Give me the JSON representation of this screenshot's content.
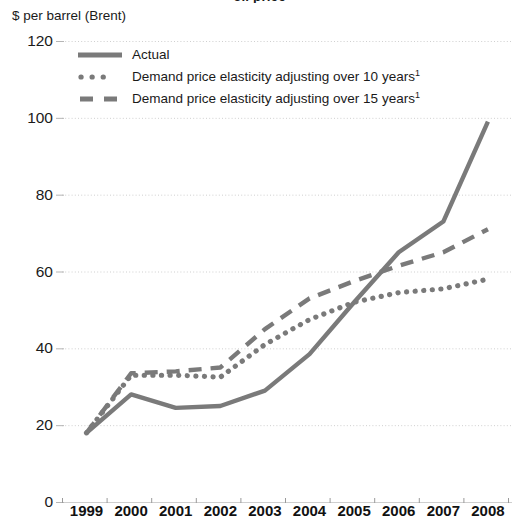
{
  "title_cropped": "oil price",
  "axis_caption": "$ per barrel (Brent)",
  "colors": {
    "line": "#7a7a7a",
    "grid": "#cfcfcf",
    "axis_text": "#1a1a1a",
    "background": "#ffffff"
  },
  "legend": {
    "items": [
      {
        "label": "Actual",
        "style": "solid",
        "swatch": "solid-line-swatch"
      },
      {
        "label": "Demand price elasticity adjusting over 10 years",
        "footnote": "1",
        "style": "dotted",
        "swatch": "dotted-line-swatch"
      },
      {
        "label": "Demand price elasticity adjusting over 15 years",
        "footnote": "1",
        "style": "dashed",
        "swatch": "dashed-line-swatch"
      }
    ]
  },
  "chart_data": {
    "type": "line",
    "title": "",
    "xlabel": "",
    "ylabel": "$ per barrel (Brent)",
    "ylim": [
      0,
      120
    ],
    "yticks": [
      0,
      20,
      40,
      60,
      80,
      100,
      120
    ],
    "grid": true,
    "legend_position": "top-left-inside",
    "categories": [
      "1999",
      "2000",
      "2001",
      "2002",
      "2003",
      "2004",
      "2005",
      "2006",
      "2007",
      "2008"
    ],
    "series": [
      {
        "name": "Actual",
        "style": "solid",
        "values": [
          18,
          28,
          24.5,
          25,
          29,
          38.5,
          52,
          65,
          73,
          99
        ]
      },
      {
        "name": "Demand price elasticity adjusting over 10 years",
        "style": "dotted",
        "values": [
          18,
          33,
          33,
          32.5,
          41,
          47.5,
          52,
          54.5,
          55.5,
          58
        ]
      },
      {
        "name": "Demand price elasticity adjusting over 15 years",
        "style": "dashed",
        "values": [
          18,
          33.5,
          34,
          35,
          45,
          53,
          57.5,
          61.5,
          65,
          71
        ]
      }
    ]
  }
}
